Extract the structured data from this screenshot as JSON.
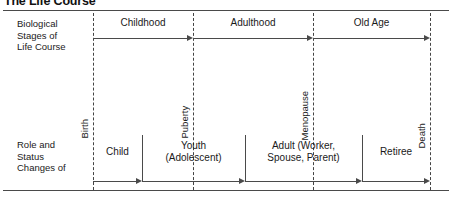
{
  "title": "The Life Course",
  "rows": [
    {
      "label_lines": [
        "Biological",
        "Stages of",
        "Life Course"
      ]
    },
    {
      "label_lines": [
        "Role and",
        "Status",
        "Changes of"
      ]
    }
  ],
  "events": [
    {
      "name": "Birth",
      "x": 93
    },
    {
      "name": "Puberty",
      "x": 193
    },
    {
      "name": "Menopause",
      "x": 313
    },
    {
      "name": "Death",
      "x": 430
    }
  ],
  "biological_stages": [
    {
      "label": "Childhood",
      "from_event": "Birth",
      "to_event": "Puberty",
      "x_start": 93,
      "x_end": 193
    },
    {
      "label": "Adulthood",
      "from_event": "Puberty",
      "to_event": "Menopause",
      "x_start": 193,
      "x_end": 313
    },
    {
      "label": "Old Age",
      "from_event": "Menopause",
      "to_event": "Death",
      "x_start": 313,
      "x_end": 430
    }
  ],
  "role_status_changes": [
    {
      "label_lines": [
        "Child"
      ],
      "x_start": 93,
      "x_end": 142
    },
    {
      "label_lines": [
        "Youth",
        "(Adolescent)"
      ],
      "x_start": 142,
      "x_end": 245
    },
    {
      "label_lines": [
        "Adult (Worker,",
        "Spouse, Parent)"
      ],
      "x_start": 245,
      "x_end": 362
    },
    {
      "label_lines": [
        "Retiree"
      ],
      "x_start": 362,
      "x_end": 430
    }
  ],
  "colors": {
    "line": "#4a4a4a",
    "text": "#1a1a1a",
    "background": "#ffffff"
  }
}
